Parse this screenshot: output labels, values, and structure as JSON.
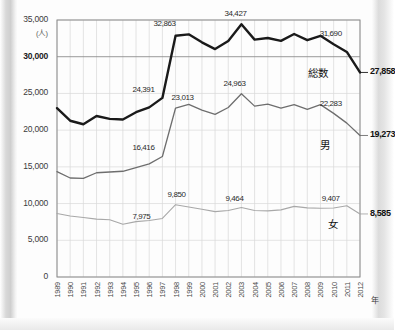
{
  "chart_data": {
    "type": "line",
    "title": "",
    "xlabel": "年",
    "ylabel": "(人)",
    "ylim": [
      0,
      35000
    ],
    "ytick_step": 5000,
    "grid": true,
    "legend_position": "inline-right",
    "x": [
      1989,
      1990,
      1991,
      1992,
      1993,
      1994,
      1995,
      1996,
      1997,
      1998,
      1999,
      2000,
      2001,
      2002,
      2003,
      2004,
      2005,
      2006,
      2007,
      2008,
      2009,
      2010,
      2011,
      2012
    ],
    "ytick_labels": [
      "0",
      "5,000",
      "10,000",
      "15,000",
      "20,000",
      "25,000",
      "30,000",
      "35,000"
    ],
    "xtick_labels": [
      "1989",
      "1990",
      "1991",
      "1992",
      "1993",
      "1994",
      "1995",
      "1996",
      "1997",
      "1998",
      "1999",
      "2000",
      "2001",
      "2002",
      "2003",
      "2004",
      "2005",
      "2006",
      "2007",
      "2008",
      "2009",
      "2010",
      "2011",
      "2012"
    ],
    "series": [
      {
        "name": "総数",
        "label": "総数",
        "color": "#1a1a1a",
        "width": 2.4,
        "end_value": "27,858",
        "values": [
          22990,
          21280,
          20800,
          21920,
          21540,
          21440,
          22440,
          23100,
          24391,
          32863,
          33048,
          31957,
          31042,
          32143,
          34427,
          32325,
          32552,
          32155,
          33093,
          32249,
          32845,
          31690,
          30651,
          27858
        ],
        "annotations": [
          {
            "x": 1997,
            "text": "24,391"
          },
          {
            "x": 1998,
            "text": "32,863"
          },
          {
            "x": 2003,
            "text": "34,427"
          },
          {
            "x": 2010,
            "text": "31,690"
          }
        ]
      },
      {
        "name": "男",
        "label": "男",
        "color": "#6e6e6e",
        "width": 1.3,
        "end_value": "19,273",
        "values": [
          14350,
          13480,
          13420,
          14200,
          14300,
          14400,
          14900,
          15400,
          16416,
          23013,
          23512,
          22727,
          22144,
          23080,
          24963,
          23272,
          23540,
          23012,
          23478,
          22831,
          23472,
          22283,
          20955,
          19273
        ],
        "annotations": [
          {
            "x": 1997,
            "text": "16,416"
          },
          {
            "x": 1998,
            "text": "23,013"
          },
          {
            "x": 2003,
            "text": "24,963"
          },
          {
            "x": 2010,
            "text": "22,283"
          }
        ]
      },
      {
        "name": "女",
        "label": "女",
        "color": "#a8a8a8",
        "width": 1.1,
        "end_value": "8,585",
        "values": [
          8640,
          8300,
          8100,
          7880,
          7800,
          7180,
          7540,
          7700,
          7975,
          9850,
          9536,
          9230,
          8898,
          9063,
          9464,
          9053,
          9012,
          9143,
          9615,
          9418,
          9373,
          9407,
          9696,
          8585
        ],
        "annotations": [
          {
            "x": 1997,
            "text": "7,975"
          },
          {
            "x": 1998,
            "text": "9,850"
          },
          {
            "x": 2003,
            "text": "9,464"
          },
          {
            "x": 2010,
            "text": "9,407"
          }
        ]
      }
    ]
  }
}
